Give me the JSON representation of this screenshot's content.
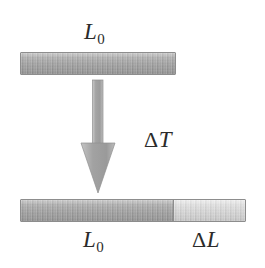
{
  "figure": {
    "background_color": "#ffffff",
    "width": 265,
    "height": 268
  },
  "labels": {
    "top_initial_length": {
      "symbol": "L",
      "subscript": "0",
      "text": "L0"
    },
    "temperature_change": {
      "delta": "Δ",
      "symbol": "T",
      "text": "ΔT"
    },
    "bottom_initial_length": {
      "symbol": "L",
      "subscript": "0",
      "text": "L0"
    },
    "length_change": {
      "delta": "Δ",
      "symbol": "L",
      "text": "ΔL"
    }
  },
  "bars": {
    "top": {
      "name": "initial-rod",
      "segments": [
        {
          "name": "original-length",
          "label": "L0",
          "shade": "dark",
          "color": "#a6a6a6"
        }
      ]
    },
    "bottom": {
      "name": "expanded-rod",
      "segments": [
        {
          "name": "original-length",
          "label": "L0",
          "shade": "dark",
          "color": "#a6a6a6"
        },
        {
          "name": "expansion-length",
          "label": "ΔL",
          "shade": "light",
          "color": "#d2d2d2"
        }
      ]
    }
  },
  "arrow": {
    "name": "heating-arrow",
    "direction": "down",
    "meaning": "ΔT",
    "color": "#a8a8a8",
    "outline_color": "#8d8d8d"
  },
  "colors": {
    "bar_dark": "#a6a6a6",
    "bar_light": "#d2d2d2",
    "bar_border": "#8d8d8d",
    "arrow": "#a8a8a8",
    "text": "#2b2b2b",
    "background": "#ffffff"
  }
}
